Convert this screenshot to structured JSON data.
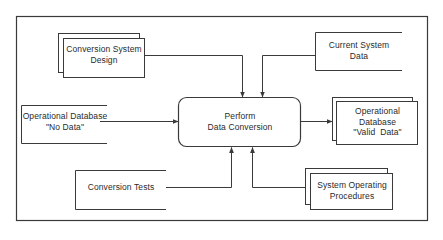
{
  "diagram": {
    "type": "data-flow",
    "colors": {
      "stroke": "#3a3a3a",
      "text": "#2a2a2a",
      "background": "#ffffff"
    },
    "process": {
      "id": "perform-data-conversion",
      "line1": "Perform",
      "line2": "Data Conversion"
    },
    "inputs": [
      {
        "id": "conversion-system-design",
        "shape": "stacked-document",
        "line1": "Conversion System",
        "line2": "Design",
        "enters": "top"
      },
      {
        "id": "current-system-data",
        "shape": "open-data-store",
        "line1": "Current System",
        "line2": "Data",
        "enters": "top"
      },
      {
        "id": "operational-database-no-data",
        "shape": "open-data-store",
        "line1": "Operational Database",
        "line2": "\"No Data\"",
        "enters": "left"
      },
      {
        "id": "conversion-tests",
        "shape": "open-data-store",
        "line1": "Conversion Tests",
        "enters": "bottom"
      },
      {
        "id": "system-operating-procedures",
        "shape": "stacked-document",
        "line1": "System Operating",
        "line2": "Procedures",
        "enters": "bottom"
      }
    ],
    "outputs": [
      {
        "id": "operational-database-valid-data",
        "shape": "stacked-document",
        "line1": "Operational",
        "line2": "Database",
        "line3": "\"Valid  Data\"",
        "exits": "right"
      }
    ]
  }
}
